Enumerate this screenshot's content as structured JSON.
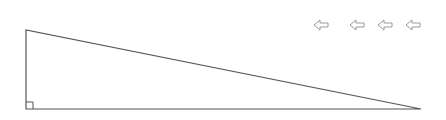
{
  "diagram": {
    "shape": "right-triangle",
    "vertices": {
      "top_left": [
        26,
        30
      ],
      "bottom_left": [
        26,
        109
      ],
      "bottom_right": [
        421,
        109
      ]
    },
    "right_angle_marker_size": 7,
    "stroke_color": "#555555"
  },
  "toolbar": {
    "buttons": [
      {
        "icon": "left-arrow-icon",
        "x": 313
      },
      {
        "icon": "left-arrow-icon",
        "x": 350
      },
      {
        "icon": "left-arrow-icon",
        "x": 377
      },
      {
        "icon": "left-arrow-icon",
        "x": 405
      }
    ],
    "icon_color": "#9a9a9a"
  }
}
